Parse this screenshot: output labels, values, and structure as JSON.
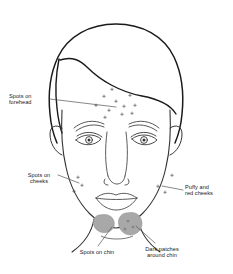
{
  "diagram": {
    "colors": {
      "outline": "#1a1a1a",
      "feature_line": "#4a4a4a",
      "patch_fill": "#a8a8a8",
      "leader_line": "#555555",
      "background": "#ffffff",
      "text": "#1a1a1a"
    }
  },
  "labels": {
    "forehead": "Spots on\nforehead",
    "cheeks": "Spots on\ncheeks",
    "puffy": "Puffy and\nred cheeks",
    "chin_spots": "Spots on chin",
    "dark_patches": "Dark patches\naround chin"
  },
  "features": {
    "forehead_spots_count": 11,
    "left_cheek_spots_count": 3,
    "right_cheek_spots_count": 3,
    "chin_patches_count": 2
  }
}
